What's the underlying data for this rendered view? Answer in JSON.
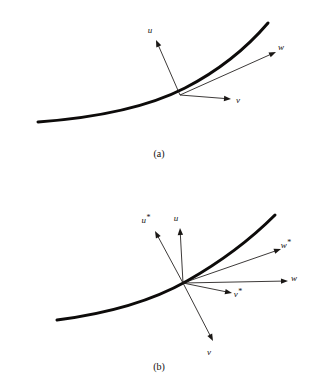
{
  "figure": {
    "background_color": "#ffffff",
    "ink_color": "#14110f",
    "curve_color": "#0d0b0a",
    "vector_color": "#1a1715",
    "panels": [
      {
        "id": "panel-a",
        "caption": "(a)",
        "caption_pos": {
          "x": 159,
          "y": 157
        },
        "curve": {
          "name": "trajectory-curve",
          "stroke_width": 3.0,
          "path": "M 38 122 C 92 118 146 108 185 88 C 222 69 250 44 268 23"
        },
        "origin": {
          "x": 180,
          "y": 95
        },
        "vectors": [
          {
            "name": "vector-u",
            "label": "u",
            "starred": false,
            "tip": {
              "x": 156,
              "y": 40
            },
            "label_pos": {
              "x": 150,
              "y": 33
            }
          },
          {
            "name": "vector-w",
            "label": "w",
            "starred": false,
            "tip": {
              "x": 276,
              "y": 52
            },
            "label_pos": {
              "x": 281,
              "y": 50
            }
          },
          {
            "name": "vector-v",
            "label": "v",
            "starred": false,
            "tip": {
              "x": 231,
              "y": 99
            },
            "label_pos": {
              "x": 238,
              "y": 103
            }
          }
        ]
      },
      {
        "id": "panel-b",
        "caption": "(b)",
        "caption_pos": {
          "x": 159,
          "y": 370
        },
        "curve": {
          "name": "trajectory-curve",
          "stroke_width": 3.0,
          "path": "M 57 320 C 104 314 150 302 187 281 C 224 260 252 238 275 215"
        },
        "origin": {
          "x": 183,
          "y": 283
        },
        "vectors": [
          {
            "name": "vector-u-star",
            "label": "u",
            "starred": true,
            "tip": {
              "x": 155,
              "y": 231
            },
            "label_pos": {
              "x": 146,
              "y": 223
            }
          },
          {
            "name": "vector-u",
            "label": "u",
            "starred": false,
            "tip": {
              "x": 180,
              "y": 228
            },
            "label_pos": {
              "x": 176,
              "y": 221
            }
          },
          {
            "name": "vector-w-star",
            "label": "w",
            "starred": true,
            "tip": {
              "x": 281,
              "y": 249
            },
            "label_pos": {
              "x": 286,
              "y": 248
            }
          },
          {
            "name": "vector-w",
            "label": "w",
            "starred": false,
            "tip": {
              "x": 288,
              "y": 281
            },
            "label_pos": {
              "x": 294,
              "y": 281
            }
          },
          {
            "name": "vector-v-star",
            "label": "v",
            "starred": true,
            "tip": {
              "x": 232,
              "y": 293
            },
            "label_pos": {
              "x": 238,
              "y": 297
            }
          },
          {
            "name": "vector-v",
            "label": "v",
            "starred": false,
            "tip": {
              "x": 213,
              "y": 341
            },
            "label_pos": {
              "x": 209,
              "y": 355
            }
          }
        ]
      }
    ]
  }
}
